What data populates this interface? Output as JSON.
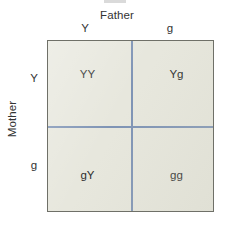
{
  "figure": {
    "type": "punnett-square",
    "top_axis_title": "Father",
    "left_axis_title": "Mother",
    "father_alleles": [
      "Y",
      "g"
    ],
    "mother_alleles": [
      "Y",
      "g"
    ],
    "cells": [
      {
        "row": "Y",
        "col": "Y",
        "genotype": "YY"
      },
      {
        "row": "Y",
        "col": "g",
        "genotype": "Yg"
      },
      {
        "row": "g",
        "col": "Y",
        "genotype": "gY"
      },
      {
        "row": "g",
        "col": "g",
        "genotype": "gg"
      }
    ],
    "colors": {
      "cell_fill": "#e7e7dd",
      "box_border": "#6f7068",
      "divider": "#7f94b5",
      "text": "#2d2d2d",
      "background": "#ffffff"
    }
  }
}
